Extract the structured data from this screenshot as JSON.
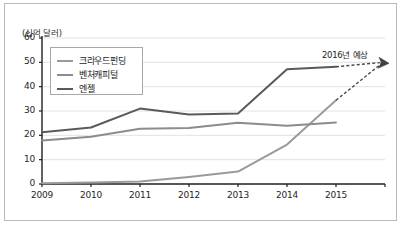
{
  "chart_data": {
    "type": "line",
    "title": "",
    "subtitle": "",
    "xlabel": "",
    "ylabel": "(십억 달러)",
    "unit_label": "(십억 달러)",
    "categories": [
      "2009",
      "2010",
      "2011",
      "2012",
      "2013",
      "2014",
      "2015"
    ],
    "x": [
      2009,
      2010,
      2011,
      2012,
      2013,
      2014,
      2015
    ],
    "xlim": [
      2009,
      2016
    ],
    "ylim": [
      0,
      60
    ],
    "yticks": [
      0,
      10,
      20,
      30,
      40,
      50,
      60
    ],
    "ytick_labels": [
      "0",
      "10",
      "20",
      "30",
      "40",
      "50",
      "60"
    ],
    "grid": true,
    "grid_axis": "y",
    "legend_position": "upper-left",
    "series": [
      {
        "name": "크라우드펀딩",
        "color": "#9a9a9a",
        "values": [
          0.3,
          0.6,
          1.0,
          2.9,
          5.1,
          16.2,
          34.4
        ],
        "forecast": {
          "label": "2016년 예상",
          "from": [
            2015,
            34.4
          ],
          "to": [
            2016,
            50.0
          ],
          "style": "dashed"
        }
      },
      {
        "name": "벤처캐피털",
        "color": "#8c8c8c",
        "values": [
          17.9,
          19.4,
          22.7,
          23.0,
          25.2,
          23.9,
          25.3
        ]
      },
      {
        "name": "엔젤",
        "color": "#5a5a5a",
        "values": [
          21.3,
          23.2,
          31.0,
          28.6,
          29.0,
          47.2,
          48.2
        ],
        "forecast": {
          "label": "2016년 예상",
          "from": [
            2015,
            48.2
          ],
          "to": [
            2016,
            50.0
          ],
          "style": "dashed"
        }
      }
    ],
    "annotations": [
      {
        "text": "2016년 예상",
        "x": 2016,
        "y": 50.0,
        "arrow": true,
        "arrow_style": "dashed-converging"
      }
    ]
  },
  "legend": {
    "items": [
      {
        "label": "크라우드펀딩",
        "color": "#9a9a9a"
      },
      {
        "label": "벤처캐피털",
        "color": "#8c8c8c"
      },
      {
        "label": "엔젤",
        "color": "#5a5a5a"
      }
    ]
  },
  "axes": {
    "unit_label": "(십억 달러)",
    "y_labels": [
      "60",
      "50",
      "40",
      "30",
      "20",
      "10",
      "0"
    ],
    "x_labels": [
      "2009",
      "2010",
      "2011",
      "2012",
      "2013",
      "2014",
      "2015"
    ]
  },
  "annotation": {
    "forecast_label": "2016년 예상"
  },
  "colors": {
    "background": "#ffffff",
    "border": "#b9b9b9",
    "axis": "#1f1f1f",
    "gridline": "#e2e2e2",
    "crowdfunding": "#9a9a9a",
    "venture_capital": "#8c8c8c",
    "angel": "#5a5a5a",
    "text": "#1d1d1d"
  }
}
